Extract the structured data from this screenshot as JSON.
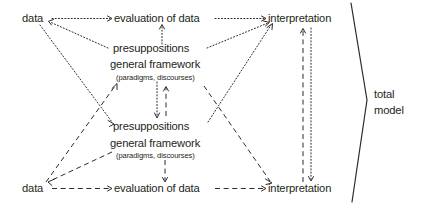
{
  "diagram": {
    "colors": {
      "ink": "#231f20",
      "line": "#2b2b2b",
      "background": "#ffffff"
    },
    "nodes": {
      "top_data": "data",
      "top_evaluation": "evaluation of data",
      "top_interpretation": "interpretation",
      "upper_presuppositions": "presuppositions",
      "upper_framework": "general framework",
      "upper_framework_note": "(paradigms, discourses)",
      "lower_presuppositions": "presuppositions",
      "lower_framework": "general framework",
      "lower_framework_note": "(paradigms, discourses)",
      "bottom_data": "data",
      "bottom_evaluation": "evaluation of data",
      "bottom_interpretation": "interpretation"
    },
    "brace_label": {
      "line1": "total",
      "line2": "model"
    },
    "edges": [
      {
        "name": "top-data-to-top-evaluation",
        "style": "dotted",
        "arrow": "end"
      },
      {
        "name": "top-evaluation-to-top-interpretation",
        "style": "dotted",
        "arrow": "end"
      },
      {
        "name": "upper-presuppositions-to-top-data",
        "style": "dotted",
        "arrow": "end"
      },
      {
        "name": "upper-presuppositions-to-top-interpretation",
        "style": "dotted",
        "arrow": "end"
      },
      {
        "name": "upper-presuppositions-to-top-evaluation",
        "style": "dotted",
        "arrow": "end"
      },
      {
        "name": "top-data-to-lower-presuppositions",
        "style": "dotted",
        "arrow": "end"
      },
      {
        "name": "lower-presuppositions-to-top-interpretation",
        "style": "dotted",
        "arrow": "end"
      },
      {
        "name": "upper-to-lower-framework",
        "style": "dotted",
        "arrow": "end"
      },
      {
        "name": "lower-to-upper-framework",
        "style": "dashed",
        "arrow": "end"
      },
      {
        "name": "bottom-data-to-upper-framework",
        "style": "dashed",
        "arrow": "end"
      },
      {
        "name": "upper-framework-to-bottom-interpretation",
        "style": "dashed",
        "arrow": "end"
      },
      {
        "name": "lower-presuppositions-to-bottom-data",
        "style": "dashed",
        "arrow": "end"
      },
      {
        "name": "lower-framework-to-bottom-evaluation",
        "style": "dashed",
        "arrow": "end"
      },
      {
        "name": "bottom-data-to-bottom-evaluation",
        "style": "dashed",
        "arrow": "end"
      },
      {
        "name": "bottom-evaluation-to-bottom-interpretation",
        "style": "dashed",
        "arrow": "end"
      },
      {
        "name": "bottom-interpretation-to-top-interpretation",
        "style": "dashed",
        "arrow": "end"
      },
      {
        "name": "top-interpretation-to-bottom-interpretation",
        "style": "dotted",
        "arrow": "end"
      }
    ]
  }
}
